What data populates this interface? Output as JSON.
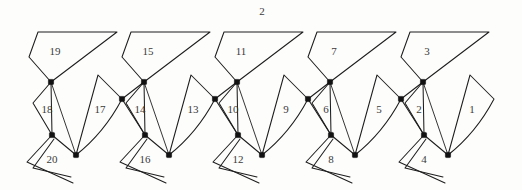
{
  "figure": {
    "caption_top": "2",
    "background": "#ffffff",
    "line_color": "#1d1d1d",
    "label_color": "#3a3a3a",
    "joint_color": "#121212",
    "unit_count": 5,
    "unit_spacing_px": 93,
    "units": [
      {
        "index": 0,
        "offset_x": 0,
        "labels": {
          "upper_region": "19",
          "left_region": "18",
          "right_region": "17",
          "claw_region": "20"
        }
      },
      {
        "index": 1,
        "offset_x": 93,
        "labels": {
          "upper_region": "15",
          "left_region": "14",
          "right_region": "13",
          "claw_region": "16"
        }
      },
      {
        "index": 2,
        "offset_x": 186,
        "labels": {
          "upper_region": "11",
          "left_region": "10",
          "right_region": "9",
          "claw_region": "12"
        }
      },
      {
        "index": 3,
        "offset_x": 279,
        "labels": {
          "upper_region": "7",
          "left_region": "6",
          "right_region": "5",
          "claw_region": "8"
        }
      },
      {
        "index": 4,
        "offset_x": 372,
        "labels": {
          "upper_region": "3",
          "left_region": "2",
          "right_region": "1",
          "claw_region": "4"
        }
      }
    ],
    "label_positions": {
      "upper_region": [
        55,
        52
      ],
      "left_region": [
        47,
        110
      ],
      "right_region": [
        100,
        110
      ],
      "claw_region": [
        52,
        160
      ],
      "caption_top": [
        262,
        11
      ]
    },
    "geometry": {
      "node_upper": [
        51,
        82
      ],
      "node_mid_left": [
        52,
        135
      ],
      "node_bottom": [
        76,
        155
      ],
      "node_junction": [
        122,
        99
      ],
      "poly_top_left": [
        38,
        32
      ],
      "poly_top_right": [
        117,
        32
      ],
      "poly_left_edge": [
        29,
        57
      ],
      "left_quad_outer": [
        33,
        103
      ],
      "right_peak": [
        98,
        75
      ],
      "claw_apex": [
        27,
        162
      ],
      "claw_tip": [
        73,
        183
      ]
    }
  }
}
